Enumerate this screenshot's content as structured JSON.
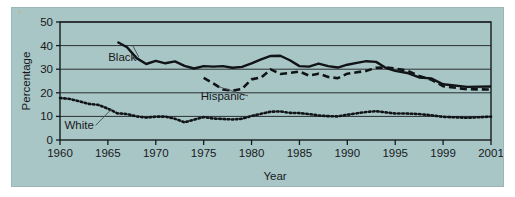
{
  "chart_data": {
    "type": "line",
    "title": "",
    "xlabel": "Year",
    "ylabel": "Percentage",
    "xlim": [
      1960,
      2001
    ],
    "ylim": [
      0,
      50
    ],
    "yticks": [
      0,
      10,
      20,
      30,
      40,
      50
    ],
    "xticks": [
      1960,
      1965,
      1970,
      1975,
      1980,
      1985,
      1990,
      1995,
      1999,
      2001
    ],
    "xtick_labels": [
      "1960",
      "1965",
      "1970",
      "1975",
      "1980",
      "1985",
      "1990",
      "1995",
      "1999",
      "2001"
    ],
    "ytick_labels": [
      "0",
      "10",
      "20",
      "30",
      "40",
      "50"
    ],
    "grid": "horizontal",
    "legend_position": "inline-annotations",
    "series": [
      {
        "name": "Black",
        "style": "solid",
        "color": "#111417",
        "label_x": 1966.5,
        "label_y": 33.5,
        "x": [
          1966,
          1967,
          1968,
          1969,
          1970,
          1971,
          1972,
          1973,
          1974,
          1975,
          1976,
          1977,
          1978,
          1979,
          1980,
          1981,
          1982,
          1983,
          1984,
          1985,
          1986,
          1987,
          1988,
          1989,
          1990,
          1991,
          1992,
          1993,
          1994,
          1995,
          1996,
          1997,
          1998,
          1999,
          2000,
          2001
        ],
        "y": [
          41.5,
          39.3,
          34.7,
          32.2,
          33.5,
          32.5,
          33.3,
          31.4,
          30.3,
          31.3,
          31.1,
          31.3,
          30.6,
          31.0,
          32.5,
          34.2,
          35.6,
          35.7,
          33.8,
          31.3,
          31.1,
          32.4,
          31.3,
          30.7,
          31.9,
          32.7,
          33.4,
          33.1,
          30.6,
          29.3,
          28.4,
          26.5,
          26.1,
          23.6,
          22.5,
          22.7
        ]
      },
      {
        "name": "Hispanic",
        "style": "dashed",
        "color": "#111417",
        "label_x": 1977.0,
        "label_y": 17.0,
        "x": [
          1975,
          1976,
          1977,
          1978,
          1979,
          1980,
          1981,
          1982,
          1983,
          1984,
          1985,
          1986,
          1987,
          1988,
          1989,
          1990,
          1991,
          1992,
          1993,
          1994,
          1995,
          1996,
          1997,
          1998,
          1999,
          2000,
          2001
        ],
        "y": [
          26.3,
          24.0,
          21.4,
          20.9,
          21.6,
          25.7,
          26.5,
          29.9,
          28.0,
          28.4,
          29.0,
          27.3,
          28.1,
          26.7,
          26.2,
          28.1,
          28.7,
          29.3,
          30.6,
          30.7,
          30.3,
          29.4,
          27.1,
          25.6,
          22.8,
          21.5,
          21.4
        ]
      },
      {
        "name": "White",
        "style": "dotted",
        "color": "#111417",
        "label_x": 1962.0,
        "label_y": 4.5,
        "x": [
          1960,
          1961,
          1962,
          1963,
          1964,
          1965,
          1966,
          1967,
          1968,
          1969,
          1970,
          1971,
          1972,
          1973,
          1974,
          1975,
          1976,
          1977,
          1978,
          1979,
          1980,
          1981,
          1982,
          1983,
          1984,
          1985,
          1986,
          1987,
          1988,
          1989,
          1990,
          1991,
          1992,
          1993,
          1994,
          1995,
          1996,
          1997,
          1998,
          1999,
          2000,
          2001
        ],
        "y": [
          17.8,
          17.4,
          16.4,
          15.3,
          14.9,
          13.3,
          11.3,
          11.0,
          10.0,
          9.5,
          9.9,
          9.9,
          9.0,
          7.5,
          8.6,
          9.7,
          9.1,
          8.9,
          8.7,
          9.0,
          10.2,
          11.1,
          12.0,
          12.1,
          11.5,
          11.4,
          11.0,
          10.4,
          10.1,
          10.0,
          10.7,
          11.3,
          11.9,
          12.2,
          11.7,
          11.2,
          11.2,
          11.0,
          10.5,
          9.8,
          9.4,
          9.9
        ]
      }
    ]
  }
}
